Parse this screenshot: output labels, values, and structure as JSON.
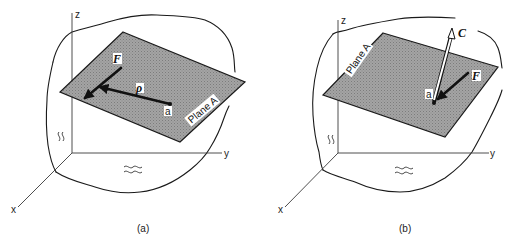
{
  "figure": {
    "panels": [
      {
        "id": "a",
        "caption": "(a)",
        "axes": {
          "z": "z",
          "y": "y",
          "x": "x"
        },
        "plane_label": "Plane A",
        "point_label": "a",
        "vectors": [
          {
            "name": "F",
            "label": "F",
            "style": "solid"
          },
          {
            "name": "rho",
            "label": "ρ",
            "style": "solid"
          }
        ]
      },
      {
        "id": "b",
        "caption": "(b)",
        "axes": {
          "z": "z",
          "y": "y",
          "x": "x"
        },
        "plane_label": "Plane A",
        "point_label": "a",
        "vectors": [
          {
            "name": "C",
            "label": "C",
            "style": "hollow"
          },
          {
            "name": "F",
            "label": "F",
            "style": "solid"
          }
        ]
      }
    ],
    "colors": {
      "plane_fill": "#9a9a9a",
      "line": "#1a1a1a",
      "background": "#ffffff"
    }
  }
}
